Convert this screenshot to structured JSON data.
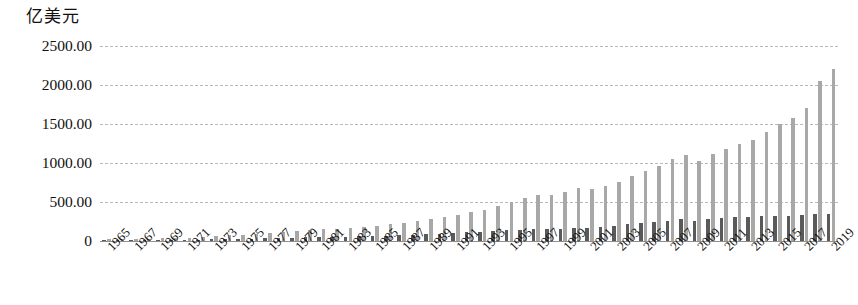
{
  "chart_data": {
    "type": "bar",
    "title": "亿美元",
    "xlabel": "",
    "ylabel": "亿美元",
    "ylim": [
      0,
      2500
    ],
    "yticks": [
      0,
      500,
      1000,
      1500,
      2000,
      2500
    ],
    "ytick_labels": [
      "0",
      "500.00",
      "1000.00",
      "1500.00",
      "2000.00",
      "2500.00"
    ],
    "grid": true,
    "legend": "none",
    "x_tick_step": 2,
    "categories": [
      "1965",
      "1966",
      "1967",
      "1968",
      "1969",
      "1970",
      "1971",
      "1972",
      "1973",
      "1974",
      "1975",
      "1976",
      "1977",
      "1978",
      "1979",
      "1980",
      "1981",
      "1982",
      "1983",
      "1984",
      "1985",
      "1986",
      "1987",
      "1988",
      "1989",
      "1990",
      "1991",
      "1992",
      "1993",
      "1994",
      "1995",
      "1996",
      "1997",
      "1998",
      "1999",
      "2000",
      "2001",
      "2002",
      "2003",
      "2004",
      "2005",
      "2006",
      "2007",
      "2008",
      "2009",
      "2010",
      "2011",
      "2012",
      "2013",
      "2014",
      "2015",
      "2016",
      "2017",
      "2018",
      "2019"
    ],
    "xtick_labels": [
      "1965",
      "1967",
      "1969",
      "1971",
      "1973",
      "1975",
      "1977",
      "1979",
      "1981",
      "1983",
      "1985",
      "1987",
      "1989",
      "1991",
      "1993",
      "1995",
      "1997",
      "1999",
      "2001",
      "2003",
      "2005",
      "2007",
      "2009",
      "2011",
      "2013",
      "2015",
      "2017",
      "2019"
    ],
    "series": [
      {
        "name": "dark-series",
        "color": "#5a5a5a",
        "values": [
          8,
          9,
          10,
          11,
          12,
          14,
          16,
          18,
          22,
          26,
          28,
          30,
          33,
          37,
          42,
          46,
          50,
          52,
          55,
          60,
          64,
          68,
          74,
          82,
          90,
          96,
          102,
          110,
          118,
          126,
          136,
          144,
          152,
          150,
          158,
          170,
          172,
          180,
          196,
          214,
          232,
          248,
          262,
          276,
          256,
          282,
          296,
          304,
          312,
          320,
          316,
          322,
          332,
          340,
          346
        ]
      },
      {
        "name": "light-series",
        "color": "#a8a8a8",
        "values": [
          22,
          24,
          27,
          30,
          34,
          39,
          45,
          52,
          62,
          72,
          80,
          88,
          98,
          110,
          124,
          138,
          150,
          158,
          168,
          182,
          196,
          212,
          232,
          258,
          286,
          312,
          336,
          368,
          404,
          448,
          498,
          552,
          596,
          586,
          622,
          680,
          672,
          700,
          760,
          828,
          892,
          968,
          1052,
          1108,
          1020,
          1112,
          1186,
          1238,
          1300,
          1392,
          1498,
          1576,
          1700,
          2050,
          2200
        ]
      }
    ]
  },
  "colors": {
    "dark_bar": "#5a5a5a",
    "light_bar": "#a8a8a8",
    "gridline": "#b9b9b9",
    "axis": "#8f8f8f",
    "text": "#111111"
  }
}
